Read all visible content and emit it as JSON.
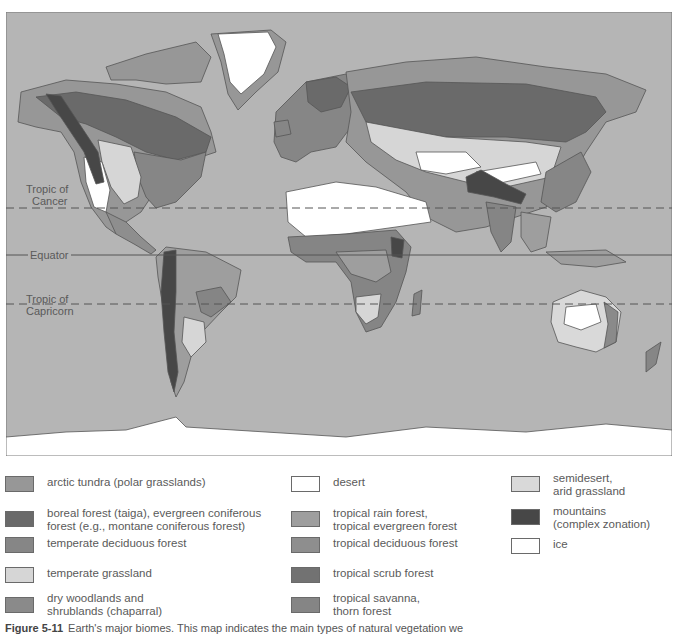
{
  "map": {
    "title": "Earth's major biomes",
    "ocean_color": "#b5b5b5",
    "reference_lines": [
      {
        "id": "tropic-of-cancer",
        "label": "Tropic of\nCancer",
        "style": "dashed"
      },
      {
        "id": "equator",
        "label": "Equator",
        "style": "solid"
      },
      {
        "id": "tropic-of-capricorn",
        "label": "Tropic of\nCapricorn",
        "style": "dashed"
      }
    ]
  },
  "labels": {
    "cancer_1": "Tropic of",
    "cancer_2": "Cancer",
    "equator": "Equator",
    "capricorn_1": "Tropic of",
    "capricorn_2": "Capricorn"
  },
  "legend": {
    "items": [
      {
        "label": "arctic tundra (polar grasslands)",
        "color": "#979797"
      },
      {
        "label": "boreal forest (taiga), evergreen coniferous\nforest (e.g., montane coniferous forest)",
        "color": "#6a6a6a"
      },
      {
        "label": "temperate deciduous forest",
        "color": "#868686"
      },
      {
        "label": "temperate grassland",
        "color": "#d6d6d6"
      },
      {
        "label": "dry woodlands and\nshrublands (chaparral)",
        "color": "#8a8a8a"
      },
      {
        "label": "desert",
        "color": "#ffffff"
      },
      {
        "label": "tropical rain forest,\ntropical evergreen forest",
        "color": "#9e9e9e"
      },
      {
        "label": "tropical deciduous forest",
        "color": "#8e8e8e"
      },
      {
        "label": "tropical scrub forest",
        "color": "#727272"
      },
      {
        "label": "tropical savanna,\nthorn forest",
        "color": "#858585"
      },
      {
        "label": "semidesert,\narid grassland",
        "color": "#d9d9d9"
      },
      {
        "label": "mountains\n(complex zonation)",
        "color": "#474747"
      },
      {
        "label": "ice",
        "color": "#ffffff"
      }
    ]
  },
  "caption": {
    "figure_number": "Figure 5-11",
    "text": "Earth's major biomes. This map indicates the main types of natural vegetation we"
  }
}
